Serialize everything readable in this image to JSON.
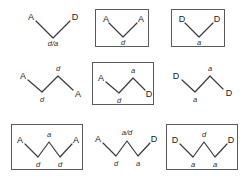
{
  "figure": {
    "background_color": "#ffffff",
    "box_stroke_color": "#595959",
    "chain_stroke_color": "#3a3a3a",
    "grid": {
      "rows": 3,
      "columns": 3
    }
  },
  "cells": [
    {
      "id": "r1c1",
      "boxed": false,
      "chain_type": "v",
      "terminals": [
        "A",
        "D"
      ],
      "conformations": [
        "d/a"
      ],
      "labels": {
        "left_terminal": "A",
        "right_terminal": "D",
        "bottom_vertex": "d/a"
      }
    },
    {
      "id": "r1c2",
      "boxed": true,
      "chain_type": "v",
      "terminals": [
        "A",
        "A"
      ],
      "conformations": [
        "d"
      ],
      "labels": {
        "left_terminal": "A",
        "right_terminal": "A",
        "bottom_vertex": "d"
      }
    },
    {
      "id": "r1c3",
      "boxed": true,
      "chain_type": "v",
      "terminals": [
        "D",
        "D"
      ],
      "conformations": [
        "a"
      ],
      "labels": {
        "left_terminal": "D",
        "right_terminal": "D",
        "bottom_vertex": "a"
      }
    },
    {
      "id": "r2c1",
      "boxed": false,
      "chain_type": "w2",
      "terminals": [
        "A",
        "A"
      ],
      "conformations": [
        "d",
        "d"
      ],
      "labels": {
        "left_terminal": "A",
        "right_terminal": "A",
        "top_vertex": "d",
        "bottom_vertex": "d"
      }
    },
    {
      "id": "r2c2",
      "boxed": true,
      "chain_type": "w2",
      "terminals": [
        "A",
        "D"
      ],
      "conformations": [
        "a",
        "d"
      ],
      "labels": {
        "left_terminal": "A",
        "right_terminal": "D",
        "top_vertex": "a",
        "bottom_vertex": "d"
      }
    },
    {
      "id": "r2c3",
      "boxed": false,
      "chain_type": "w2",
      "terminals": [
        "D",
        "D"
      ],
      "conformations": [
        "a",
        "a"
      ],
      "labels": {
        "left_terminal": "D",
        "right_terminal": "D",
        "top_vertex": "a",
        "bottom_vertex": "a"
      }
    },
    {
      "id": "r3c1",
      "boxed": true,
      "chain_type": "w3",
      "terminals": [
        "A",
        "A"
      ],
      "conformations": [
        "d",
        "a",
        "d"
      ],
      "labels": {
        "left_terminal": "A",
        "right_terminal": "A",
        "top_vertex": "a",
        "bottom_left_vertex": "d",
        "bottom_right_vertex": "d"
      }
    },
    {
      "id": "r3c2",
      "boxed": false,
      "chain_type": "w3",
      "terminals": [
        "A",
        "D"
      ],
      "conformations": [
        "d",
        "a/d",
        "a"
      ],
      "labels": {
        "left_terminal": "A",
        "right_terminal": "D",
        "top_vertex": "a/d",
        "bottom_left_vertex": "d",
        "bottom_right_vertex": "a"
      }
    },
    {
      "id": "r3c3",
      "boxed": true,
      "chain_type": "w3",
      "terminals": [
        "D",
        "D"
      ],
      "conformations": [
        "a",
        "d",
        "a"
      ],
      "labels": {
        "left_terminal": "D",
        "right_terminal": "D",
        "top_vertex": "d",
        "bottom_left_vertex": "a",
        "bottom_right_vertex": "a"
      }
    }
  ]
}
